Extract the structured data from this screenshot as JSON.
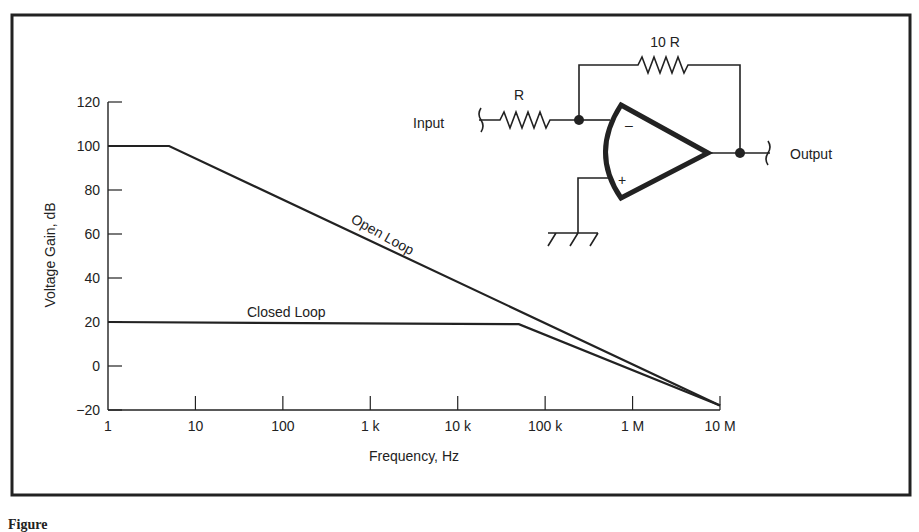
{
  "chart_data": {
    "type": "line",
    "title": "",
    "xlabel": "Frequency, Hz",
    "ylabel": "Voltage Gain, dB",
    "xscale": "log",
    "xlim": [
      1,
      10000000
    ],
    "ylim": [
      -20,
      120
    ],
    "grid": false,
    "x_ticks": [
      {
        "value": 1,
        "label": "1"
      },
      {
        "value": 10,
        "label": "10"
      },
      {
        "value": 100,
        "label": "100"
      },
      {
        "value": 1000,
        "label": "1 k"
      },
      {
        "value": 10000,
        "label": "10 k"
      },
      {
        "value": 100000,
        "label": "100 k"
      },
      {
        "value": 1000000,
        "label": "1 M"
      },
      {
        "value": 10000000,
        "label": "10 M"
      }
    ],
    "y_ticks": [
      {
        "value": 120,
        "label": "120"
      },
      {
        "value": 100,
        "label": "100"
      },
      {
        "value": 80,
        "label": "80"
      },
      {
        "value": 60,
        "label": "60"
      },
      {
        "value": 40,
        "label": "40"
      },
      {
        "value": 20,
        "label": "20"
      },
      {
        "value": 0,
        "label": "0"
      },
      {
        "value": -20,
        "label": "−20"
      }
    ],
    "series": [
      {
        "name": "Open Loop",
        "label": "Open Loop",
        "points": [
          [
            1,
            100
          ],
          [
            5,
            100
          ],
          [
            10000000,
            -18
          ]
        ]
      },
      {
        "name": "Closed Loop",
        "label": "Closed Loop",
        "points": [
          [
            1,
            20
          ],
          [
            50000,
            19
          ],
          [
            10000000,
            -18
          ]
        ]
      }
    ]
  },
  "schematic": {
    "input_label": "Input",
    "output_label": "Output",
    "input_resistor_label": "R",
    "feedback_resistor_label": "10 R",
    "inverting_sign": "–",
    "noninverting_sign": "+"
  },
  "caption": {
    "text": "Figure"
  }
}
